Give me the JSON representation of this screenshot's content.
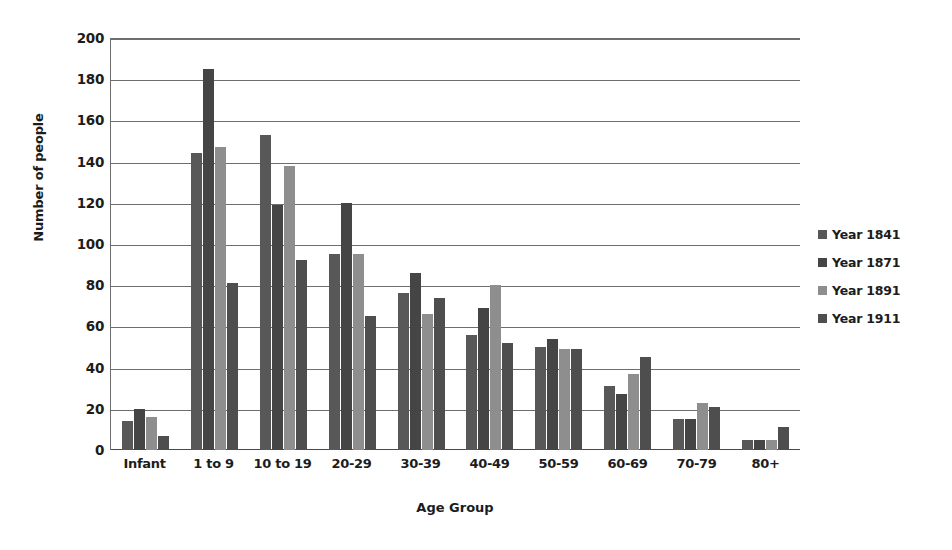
{
  "chart_data": {
    "type": "bar",
    "title": "",
    "xlabel": "Age Group",
    "ylabel": "Number of people",
    "categories": [
      "Infant",
      "1 to 9",
      "10 to 19",
      "20-29",
      "30-39",
      "40-49",
      "50-59",
      "60-69",
      "70-79",
      "80+"
    ],
    "series": [
      {
        "name": "Year 1841",
        "color": "#585858",
        "values": [
          14,
          144,
          153,
          95,
          76,
          56,
          50,
          31,
          15,
          5
        ]
      },
      {
        "name": "Year 1871",
        "color": "#454545",
        "values": [
          20,
          185,
          119,
          120,
          86,
          69,
          54,
          27,
          15,
          5
        ]
      },
      {
        "name": "Year 1891",
        "color": "#8e8e8e",
        "values": [
          16,
          147,
          138,
          95,
          66,
          80,
          49,
          37,
          23,
          5
        ]
      },
      {
        "name": "Year 1911",
        "color": "#4e4e4e",
        "values": [
          7,
          81,
          92,
          65,
          74,
          52,
          49,
          45,
          21,
          11
        ]
      }
    ],
    "ylim": [
      0,
      200
    ],
    "y_ticks": [
      0,
      20,
      40,
      60,
      80,
      100,
      120,
      140,
      160,
      180,
      200
    ],
    "grid": true,
    "legend_position": "right"
  },
  "axes": {
    "y_title": "Number of people",
    "x_title": "Age Group"
  },
  "colors": {
    "axis": "#6e6e6e",
    "grid": "#6e6e6e",
    "text": "#1c1c1c",
    "background": "#ffffff"
  }
}
